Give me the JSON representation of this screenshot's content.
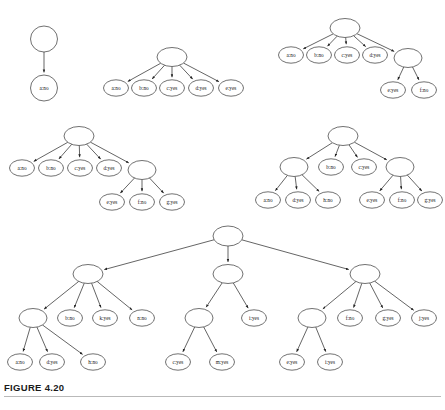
{
  "figure": {
    "caption": "FIGURE 4.20",
    "node_fill": "#ffffff",
    "node_stroke": "#333333",
    "edge_color": "#222222",
    "background": "#ffffff",
    "rx": 11.5,
    "ry": 8.0
  },
  "trees": [
    {
      "id": "tree-1",
      "nodes": [
        {
          "id": "t1n0",
          "label": "",
          "x": 44,
          "y": 39,
          "rx": 13.5,
          "ry": 13.0
        },
        {
          "id": "t1n1",
          "label": "a:no",
          "x": 44,
          "y": 88,
          "rx": 13.5,
          "ry": 13.0
        }
      ],
      "edges": [
        {
          "from": "t1n0",
          "to": "t1n1"
        }
      ]
    },
    {
      "id": "tree-2",
      "nodes": [
        {
          "id": "t2n0",
          "label": "",
          "x": 172,
          "y": 57,
          "rx": 15.0,
          "ry": 9.5
        },
        {
          "id": "t2n1",
          "label": "a:no",
          "x": 116,
          "y": 88,
          "rx": 12.5,
          "ry": 8.2
        },
        {
          "id": "t2n2",
          "label": "b:no",
          "x": 144,
          "y": 88,
          "rx": 12.5,
          "ry": 8.2
        },
        {
          "id": "t2n3",
          "label": "c:yes",
          "x": 172,
          "y": 88,
          "rx": 12.5,
          "ry": 8.2
        },
        {
          "id": "t2n4",
          "label": "d:yes",
          "x": 201,
          "y": 88,
          "rx": 12.5,
          "ry": 8.2
        },
        {
          "id": "t2n5",
          "label": "e:yes",
          "x": 231,
          "y": 88,
          "rx": 12.5,
          "ry": 8.2
        }
      ],
      "edges": [
        {
          "from": "t2n0",
          "to": "t2n1"
        },
        {
          "from": "t2n0",
          "to": "t2n2"
        },
        {
          "from": "t2n0",
          "to": "t2n3"
        },
        {
          "from": "t2n0",
          "to": "t2n4"
        },
        {
          "from": "t2n0",
          "to": "t2n5"
        }
      ]
    },
    {
      "id": "tree-3",
      "nodes": [
        {
          "id": "t3n0",
          "label": "",
          "x": 345,
          "y": 28,
          "rx": 15.0,
          "ry": 9.5
        },
        {
          "id": "t3n1",
          "label": "a:no",
          "x": 291,
          "y": 55,
          "rx": 12.5,
          "ry": 8.2
        },
        {
          "id": "t3n2",
          "label": "b:no",
          "x": 319,
          "y": 55,
          "rx": 12.5,
          "ry": 8.2
        },
        {
          "id": "t3n3",
          "label": "c:yes",
          "x": 347,
          "y": 55,
          "rx": 12.5,
          "ry": 8.2
        },
        {
          "id": "t3n4",
          "label": "d:yes",
          "x": 375,
          "y": 55,
          "rx": 12.5,
          "ry": 8.2
        },
        {
          "id": "t3n5",
          "label": "",
          "x": 408,
          "y": 58,
          "rx": 14.0,
          "ry": 9.5
        },
        {
          "id": "t3n6",
          "label": "e:yes",
          "x": 393,
          "y": 90,
          "rx": 12.5,
          "ry": 8.2
        },
        {
          "id": "t3n7",
          "label": "f:no",
          "x": 424,
          "y": 90,
          "rx": 12.5,
          "ry": 8.2
        }
      ],
      "edges": [
        {
          "from": "t3n0",
          "to": "t3n1"
        },
        {
          "from": "t3n0",
          "to": "t3n2"
        },
        {
          "from": "t3n0",
          "to": "t3n3"
        },
        {
          "from": "t3n0",
          "to": "t3n4"
        },
        {
          "from": "t3n0",
          "to": "t3n5"
        },
        {
          "from": "t3n5",
          "to": "t3n6"
        },
        {
          "from": "t3n5",
          "to": "t3n7"
        }
      ]
    },
    {
      "id": "tree-4",
      "nodes": [
        {
          "id": "t4n0",
          "label": "",
          "x": 79,
          "y": 136,
          "rx": 15.0,
          "ry": 9.5
        },
        {
          "id": "t4n1",
          "label": "a:no",
          "x": 22,
          "y": 168,
          "rx": 12.5,
          "ry": 8.2
        },
        {
          "id": "t4n2",
          "label": "b:no",
          "x": 51,
          "y": 168,
          "rx": 12.5,
          "ry": 8.2
        },
        {
          "id": "t4n3",
          "label": "c:yes",
          "x": 80,
          "y": 168,
          "rx": 12.5,
          "ry": 8.2
        },
        {
          "id": "t4n4",
          "label": "d:yes",
          "x": 109,
          "y": 168,
          "rx": 12.5,
          "ry": 8.2
        },
        {
          "id": "t4n5",
          "label": "",
          "x": 142,
          "y": 170,
          "rx": 14.0,
          "ry": 9.5
        },
        {
          "id": "t4n6",
          "label": "e:yes",
          "x": 112,
          "y": 202,
          "rx": 12.5,
          "ry": 8.2
        },
        {
          "id": "t4n7",
          "label": "f:no",
          "x": 142,
          "y": 202,
          "rx": 12.5,
          "ry": 8.2
        },
        {
          "id": "t4n8",
          "label": "g:yes",
          "x": 172,
          "y": 202,
          "rx": 12.5,
          "ry": 8.2
        }
      ],
      "edges": [
        {
          "from": "t4n0",
          "to": "t4n1"
        },
        {
          "from": "t4n0",
          "to": "t4n2"
        },
        {
          "from": "t4n0",
          "to": "t4n3"
        },
        {
          "from": "t4n0",
          "to": "t4n4"
        },
        {
          "from": "t4n0",
          "to": "t4n5"
        },
        {
          "from": "t4n5",
          "to": "t4n6"
        },
        {
          "from": "t4n5",
          "to": "t4n7"
        },
        {
          "from": "t4n5",
          "to": "t4n8"
        }
      ]
    },
    {
      "id": "tree-5",
      "nodes": [
        {
          "id": "t5n0",
          "label": "",
          "x": 343,
          "y": 136,
          "rx": 15.0,
          "ry": 9.5
        },
        {
          "id": "t5n1",
          "label": "",
          "x": 294,
          "y": 167,
          "rx": 14.0,
          "ry": 9.5
        },
        {
          "id": "t5n2",
          "label": "b:no",
          "x": 331,
          "y": 167,
          "rx": 12.5,
          "ry": 8.2
        },
        {
          "id": "t5n3",
          "label": "c:yes",
          "x": 364,
          "y": 167,
          "rx": 12.5,
          "ry": 8.2
        },
        {
          "id": "t5n4",
          "label": "",
          "x": 400,
          "y": 167,
          "rx": 14.0,
          "ry": 9.5
        },
        {
          "id": "t5n5",
          "label": "a:no",
          "x": 268,
          "y": 200,
          "rx": 12.5,
          "ry": 8.2
        },
        {
          "id": "t5n6",
          "label": "d:yes",
          "x": 298,
          "y": 200,
          "rx": 12.5,
          "ry": 8.2
        },
        {
          "id": "t5n7",
          "label": "h:no",
          "x": 328,
          "y": 200,
          "rx": 12.5,
          "ry": 8.2
        },
        {
          "id": "t5n8",
          "label": "e:yes",
          "x": 372,
          "y": 200,
          "rx": 12.5,
          "ry": 8.2
        },
        {
          "id": "t5n9",
          "label": "f:no",
          "x": 402,
          "y": 200,
          "rx": 12.5,
          "ry": 8.2
        },
        {
          "id": "t5n10",
          "label": "g:yes",
          "x": 430,
          "y": 200,
          "rx": 12.5,
          "ry": 8.2
        }
      ],
      "edges": [
        {
          "from": "t5n0",
          "to": "t5n1"
        },
        {
          "from": "t5n0",
          "to": "t5n2"
        },
        {
          "from": "t5n0",
          "to": "t5n3"
        },
        {
          "from": "t5n0",
          "to": "t5n4"
        },
        {
          "from": "t5n1",
          "to": "t5n5"
        },
        {
          "from": "t5n1",
          "to": "t5n6"
        },
        {
          "from": "t5n1",
          "to": "t5n7"
        },
        {
          "from": "t5n4",
          "to": "t5n8"
        },
        {
          "from": "t5n4",
          "to": "t5n9"
        },
        {
          "from": "t5n4",
          "to": "t5n10"
        }
      ]
    },
    {
      "id": "tree-6",
      "nodes": [
        {
          "id": "t6n0",
          "label": "",
          "x": 228,
          "y": 236,
          "rx": 15.0,
          "ry": 10.0
        },
        {
          "id": "t6n1",
          "label": "",
          "x": 88,
          "y": 274,
          "rx": 15.0,
          "ry": 9.5
        },
        {
          "id": "t6n2",
          "label": "",
          "x": 228,
          "y": 274,
          "rx": 15.0,
          "ry": 9.5
        },
        {
          "id": "t6n3",
          "label": "",
          "x": 365,
          "y": 274,
          "rx": 15.0,
          "ry": 9.5
        },
        {
          "id": "t6n4",
          "label": "",
          "x": 33,
          "y": 318,
          "rx": 14.0,
          "ry": 9.5
        },
        {
          "id": "t6n5",
          "label": "b:no",
          "x": 70,
          "y": 318,
          "rx": 12.5,
          "ry": 8.2
        },
        {
          "id": "t6n6",
          "label": "k:yes",
          "x": 105,
          "y": 318,
          "rx": 12.5,
          "ry": 8.2
        },
        {
          "id": "t6n7",
          "label": "n:no",
          "x": 142,
          "y": 318,
          "rx": 12.5,
          "ry": 8.2
        },
        {
          "id": "t6n8",
          "label": "a:no",
          "x": 20,
          "y": 362,
          "rx": 12.5,
          "ry": 8.2
        },
        {
          "id": "t6n9",
          "label": "d:yes",
          "x": 52,
          "y": 362,
          "rx": 12.5,
          "ry": 8.2
        },
        {
          "id": "t6n10",
          "label": "h:no",
          "x": 93,
          "y": 362,
          "rx": 12.5,
          "ry": 8.2
        },
        {
          "id": "t6n11",
          "label": "",
          "x": 199,
          "y": 318,
          "rx": 14.0,
          "ry": 9.5
        },
        {
          "id": "t6n12",
          "label": "i:yes",
          "x": 254,
          "y": 318,
          "rx": 12.5,
          "ry": 8.2
        },
        {
          "id": "t6n13",
          "label": "c:yes",
          "x": 178,
          "y": 362,
          "rx": 12.5,
          "ry": 8.2
        },
        {
          "id": "t6n14",
          "label": "m:yes",
          "x": 222,
          "y": 362,
          "rx": 12.5,
          "ry": 8.2
        },
        {
          "id": "t6n15",
          "label": "",
          "x": 312,
          "y": 318,
          "rx": 14.0,
          "ry": 9.5
        },
        {
          "id": "t6n16",
          "label": "f:no",
          "x": 350,
          "y": 318,
          "rx": 12.5,
          "ry": 8.2
        },
        {
          "id": "t6n17",
          "label": "g:yes",
          "x": 388,
          "y": 318,
          "rx": 12.5,
          "ry": 8.2
        },
        {
          "id": "t6n18",
          "label": "j:yes",
          "x": 424,
          "y": 318,
          "rx": 12.5,
          "ry": 8.2
        },
        {
          "id": "t6n19",
          "label": "e:yes",
          "x": 292,
          "y": 362,
          "rx": 12.5,
          "ry": 8.2
        },
        {
          "id": "t6n20",
          "label": "i:yes",
          "x": 330,
          "y": 362,
          "rx": 12.5,
          "ry": 8.2
        }
      ],
      "edges": [
        {
          "from": "t6n0",
          "to": "t6n1"
        },
        {
          "from": "t6n0",
          "to": "t6n2"
        },
        {
          "from": "t6n0",
          "to": "t6n3"
        },
        {
          "from": "t6n1",
          "to": "t6n4"
        },
        {
          "from": "t6n1",
          "to": "t6n5"
        },
        {
          "from": "t6n1",
          "to": "t6n6"
        },
        {
          "from": "t6n1",
          "to": "t6n7"
        },
        {
          "from": "t6n4",
          "to": "t6n8"
        },
        {
          "from": "t6n4",
          "to": "t6n9"
        },
        {
          "from": "t6n4",
          "to": "t6n10"
        },
        {
          "from": "t6n2",
          "to": "t6n11"
        },
        {
          "from": "t6n2",
          "to": "t6n12"
        },
        {
          "from": "t6n11",
          "to": "t6n13"
        },
        {
          "from": "t6n11",
          "to": "t6n14"
        },
        {
          "from": "t6n3",
          "to": "t6n15"
        },
        {
          "from": "t6n3",
          "to": "t6n16"
        },
        {
          "from": "t6n3",
          "to": "t6n17"
        },
        {
          "from": "t6n3",
          "to": "t6n18"
        },
        {
          "from": "t6n15",
          "to": "t6n19"
        },
        {
          "from": "t6n15",
          "to": "t6n20"
        }
      ]
    }
  ]
}
